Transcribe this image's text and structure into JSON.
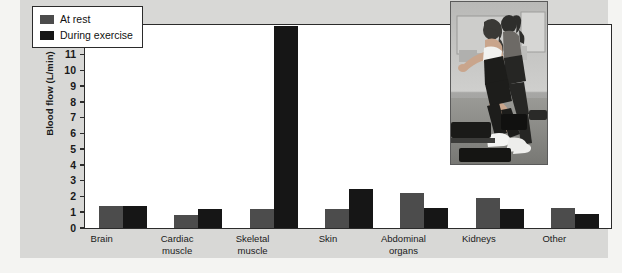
{
  "chart_data": {
    "type": "bar",
    "title": "",
    "xlabel": "",
    "ylabel": "Blood flow (L/min)",
    "ylim": [
      0,
      13
    ],
    "yticks": [
      0,
      1,
      2,
      3,
      4,
      5,
      6,
      7,
      8,
      9,
      10,
      11,
      12,
      13
    ],
    "grid": false,
    "legend_position": "top-left",
    "categories": [
      "Brain",
      "Cardiac\nmuscle",
      "Skeletal\nmuscle",
      "Skin",
      "Abdominal\norgans",
      "Kidneys",
      "Other"
    ],
    "series": [
      {
        "name": "At rest",
        "color": "#4c4c4c",
        "values": [
          1.4,
          0.8,
          1.2,
          1.2,
          2.2,
          1.9,
          1.3
        ]
      },
      {
        "name": "During exercise",
        "color": "#161616",
        "values": [
          1.4,
          1.2,
          12.8,
          2.5,
          1.3,
          1.2,
          0.9
        ]
      }
    ]
  },
  "legend": {
    "items": [
      {
        "label": "At rest",
        "swatch": "rest"
      },
      {
        "label": "During exercise",
        "swatch": "exercise"
      }
    ]
  },
  "inset": {
    "name": "step-aerobics-photo",
    "description": "Two women exercising on step platforms in a gym"
  },
  "colors": {
    "at_rest": "#4c4c4c",
    "during_exercise": "#161616",
    "panel_background": "#d8d8d6",
    "plot_background": "#ffffff",
    "axis": "#2b2b2b"
  }
}
